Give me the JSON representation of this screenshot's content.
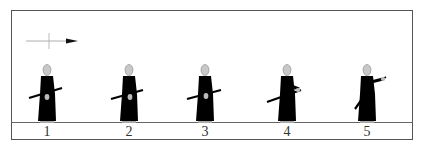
{
  "diagram": {
    "type": "sequence",
    "direction_indicator": {
      "icon": "arrow-right-icon"
    },
    "steps": [
      {
        "label": "1",
        "pose": "standing, sword at hip"
      },
      {
        "label": "2",
        "pose": "standing, sword at hip"
      },
      {
        "label": "3",
        "pose": "standing, sword at hip"
      },
      {
        "label": "4",
        "pose": "hand on hilt"
      },
      {
        "label": "5",
        "pose": "drawing sword forward"
      }
    ]
  },
  "colors": {
    "figure": "#000000",
    "head": "#c8c8c8",
    "frame": "#555555",
    "ground": "#666666"
  }
}
